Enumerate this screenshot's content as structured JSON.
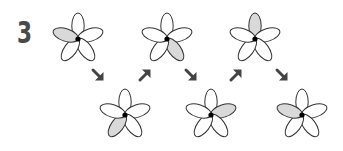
{
  "problem": {
    "number": "3",
    "colors": {
      "outline": "#333333",
      "shade": "#d9d9d9",
      "center": "#000000",
      "arrow": "#444444",
      "number": "#4a4a4a"
    },
    "petal_index_legend": [
      "top",
      "upper-right",
      "lower-right",
      "lower-left",
      "upper-left"
    ],
    "flowers": [
      {
        "id": "flower-1",
        "row": "top",
        "x": 47,
        "y": 8,
        "shaded_petal": 4
      },
      {
        "id": "flower-2",
        "row": "bottom",
        "x": 94,
        "y": 84,
        "shaded_petal": 3
      },
      {
        "id": "flower-3",
        "row": "top",
        "x": 136,
        "y": 8,
        "shaded_petal": 2
      },
      {
        "id": "flower-4",
        "row": "bottom",
        "x": 180,
        "y": 84,
        "shaded_petal": 1
      },
      {
        "id": "flower-5",
        "row": "top",
        "x": 224,
        "y": 8,
        "shaded_petal": 0
      },
      {
        "id": "flower-6",
        "row": "bottom",
        "x": 271,
        "y": 84,
        "shaded_petal": 4
      }
    ],
    "arrows": [
      {
        "direction": "down-right",
        "glyph": "↘",
        "x": 90,
        "y": 67
      },
      {
        "direction": "up-right",
        "glyph": "↗",
        "x": 137,
        "y": 67
      },
      {
        "direction": "down-right",
        "glyph": "↘",
        "x": 183,
        "y": 67
      },
      {
        "direction": "up-right",
        "glyph": "↗",
        "x": 228,
        "y": 67
      },
      {
        "direction": "down-right",
        "glyph": "↘",
        "x": 274,
        "y": 67
      }
    ]
  }
}
